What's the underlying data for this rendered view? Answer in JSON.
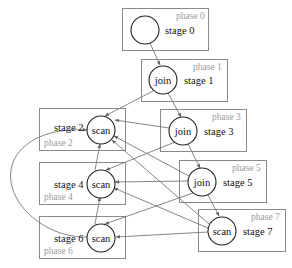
{
  "diagram": {
    "type": "staged query plan",
    "phases": [
      {
        "label": "phase 0",
        "stage": "stage 0",
        "op": ""
      },
      {
        "label": "phase 1",
        "stage": "stage 1",
        "op": "join"
      },
      {
        "label": "phase 2",
        "stage": "stage 2",
        "op": "scan"
      },
      {
        "label": "phase 3",
        "stage": "stage 3",
        "op": "join"
      },
      {
        "label": "phase 4",
        "stage": "stage 4",
        "op": "scan"
      },
      {
        "label": "phase 5",
        "stage": "stage 5",
        "op": "join"
      },
      {
        "label": "phase 6",
        "stage": "stage 6",
        "op": "scan"
      },
      {
        "label": "phase 7",
        "stage": "stage 7",
        "op": "scan"
      }
    ],
    "edges": [
      {
        "from": "stage 0",
        "to": "stage 1"
      },
      {
        "from": "stage 1",
        "to": "stage 2"
      },
      {
        "from": "stage 1",
        "to": "stage 3"
      },
      {
        "from": "stage 3",
        "to": "stage 2"
      },
      {
        "from": "stage 3",
        "to": "stage 4"
      },
      {
        "from": "stage 3",
        "to": "stage 5"
      },
      {
        "from": "stage 5",
        "to": "stage 2"
      },
      {
        "from": "stage 5",
        "to": "stage 4"
      },
      {
        "from": "stage 5",
        "to": "stage 6"
      },
      {
        "from": "stage 5",
        "to": "stage 7"
      },
      {
        "from": "stage 7",
        "to": "stage 2"
      },
      {
        "from": "stage 7",
        "to": "stage 4"
      },
      {
        "from": "stage 7",
        "to": "stage 6"
      },
      {
        "from": "stage 4",
        "to": "stage 2"
      },
      {
        "from": "stage 6",
        "to": "stage 4"
      },
      {
        "from": "stage 6",
        "to": "stage 2"
      }
    ],
    "colors": {
      "box_border": "#8a8a8a",
      "node_border": "#222222",
      "edge": "#777777",
      "phase_text": "#9a9a9a",
      "text": "#111111"
    }
  }
}
